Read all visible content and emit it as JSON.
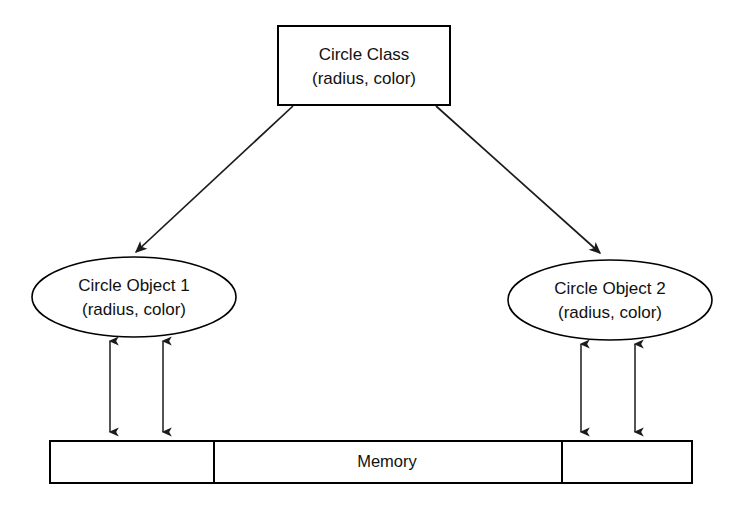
{
  "diagram": {
    "colors": {
      "background": "#ffffff",
      "stroke": "#000000",
      "text": "#111111",
      "arrow": "#1b1b1b"
    },
    "class_box": {
      "line1": "Circle Class",
      "line2": "(radius, color)"
    },
    "objects": [
      {
        "id": "circle-object-1",
        "line1": "Circle Object 1",
        "line2": "(radius, color)"
      },
      {
        "id": "circle-object-2",
        "line1": "Circle Object 2",
        "line2": "(radius, color)"
      }
    ],
    "memory": {
      "label": "Memory",
      "segments": [
        {
          "id": "segment-left",
          "label": ""
        },
        {
          "id": "segment-middle",
          "label": "Memory"
        },
        {
          "id": "segment-right",
          "label": ""
        }
      ]
    },
    "connections": [
      {
        "id": "class-to-object-1",
        "from": "Circle Class",
        "to": "Circle Object 1",
        "style": "single-arrow"
      },
      {
        "id": "class-to-object-2",
        "from": "Circle Class",
        "to": "Circle Object 2",
        "style": "single-arrow"
      },
      {
        "id": "object-1-memory-link-a",
        "from": "Circle Object 1",
        "to": "Memory",
        "style": "double-arrow"
      },
      {
        "id": "object-1-memory-link-b",
        "from": "Circle Object 1",
        "to": "Memory",
        "style": "double-arrow"
      },
      {
        "id": "object-2-memory-link-a",
        "from": "Circle Object 2",
        "to": "Memory",
        "style": "double-arrow"
      },
      {
        "id": "object-2-memory-link-b",
        "from": "Circle Object 2",
        "to": "Memory",
        "style": "double-arrow"
      }
    ]
  }
}
